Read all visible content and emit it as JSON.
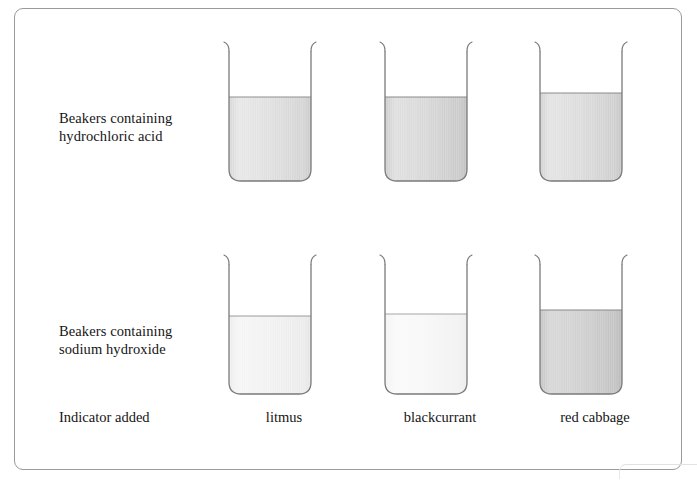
{
  "figure": {
    "row_labels": {
      "acid": "Beakers containing\nhydrochloric acid",
      "alkali": "Beakers containing\nsodium hydroxide",
      "indicator": "Indicator added"
    },
    "columns": [
      {
        "id": "litmus",
        "caption": "litmus"
      },
      {
        "id": "blackcurrant",
        "caption": "blackcurrant"
      },
      {
        "id": "red-cabbage",
        "caption": "red cabbage"
      }
    ],
    "beakers": [
      {
        "row": "acid",
        "column": "litmus",
        "fill_level": "high",
        "fill_shade": "#d9d9d9",
        "fill_top": "#e4e4e4"
      },
      {
        "row": "acid",
        "column": "blackcurrant",
        "fill_level": "high",
        "fill_shade": "#cfcfcf",
        "fill_top": "#dcdcdc"
      },
      {
        "row": "acid",
        "column": "red-cabbage",
        "fill_level": "high",
        "fill_shade": "#d4d4d4",
        "fill_top": "#e0e0e0"
      },
      {
        "row": "alkali",
        "column": "litmus",
        "fill_level": "medium",
        "fill_shade": "#f0f0f0",
        "fill_top": "#f6f6f6"
      },
      {
        "row": "alkali",
        "column": "blackcurrant",
        "fill_level": "medium",
        "fill_shade": "#f6f6f6",
        "fill_top": "#fafafa"
      },
      {
        "row": "alkali",
        "column": "red-cabbage",
        "fill_level": "medium",
        "fill_shade": "#c8c8c8",
        "fill_top": "#d6d6d6"
      }
    ],
    "colors": {
      "frame_border": "#9a9a9a",
      "beaker_outline": "#7a7a7a",
      "background": "#ffffff",
      "text": "#151515"
    }
  }
}
